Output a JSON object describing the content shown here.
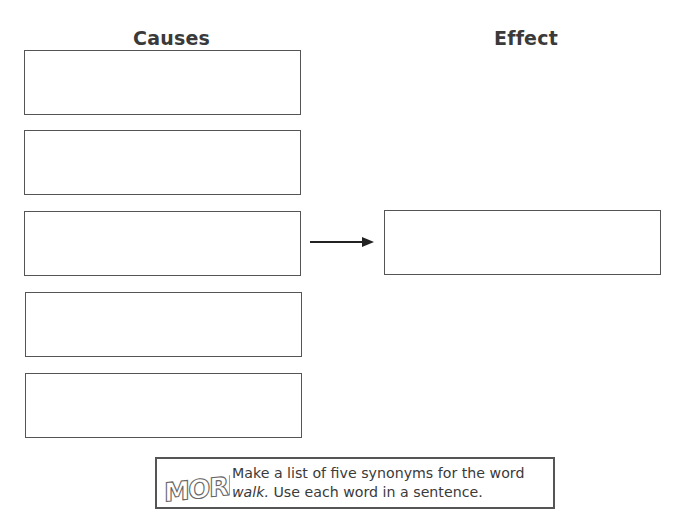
{
  "organizer": {
    "causes_heading": "Causes",
    "effect_heading": "Effect",
    "cause_boxes": [
      "",
      "",
      "",
      "",
      ""
    ],
    "effect_box": ""
  },
  "more_activity": {
    "logo_text": "MORE!",
    "line1": "Make a list of five synonyms for the word",
    "line2_italic": "walk.",
    "line2_rest": " Use each word in a sentence."
  }
}
